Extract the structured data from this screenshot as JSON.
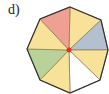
{
  "label": "d)",
  "octagon": {
    "sectors": [
      {
        "name": "top-right",
        "color": "#f8e29a"
      },
      {
        "name": "right-upper",
        "color": "#b4bfcf"
      },
      {
        "name": "right-lower",
        "color": "#f8e29a"
      },
      {
        "name": "bottom-right",
        "color": "#ffffff"
      },
      {
        "name": "bottom-left",
        "color": "#f8e29a"
      },
      {
        "name": "left-lower",
        "color": "#b9d29a"
      },
      {
        "name": "left-upper",
        "color": "#f8e29a"
      },
      {
        "name": "top-left",
        "color": "#f0a090"
      }
    ],
    "outline_color": "#333333",
    "center_dot_color": "#e8301c"
  }
}
